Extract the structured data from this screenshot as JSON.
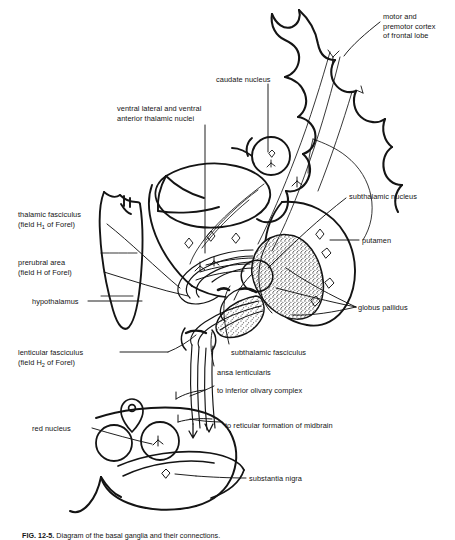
{
  "figure": {
    "domain": "anatomical-line-diagram",
    "background_color": "#ffffff",
    "ink_color": "#141414",
    "stipple_color": "#2b2b2b"
  },
  "labels": {
    "motor_cortex": {
      "id": "motor-and-premotor-cortex",
      "lines": [
        "motor and",
        "premotor cortex",
        "of frontal lobe"
      ],
      "x": 383,
      "y": 12,
      "align": "left"
    },
    "caudate_nucleus": {
      "id": "caudate-nucleus",
      "lines": [
        "caudate nucleus"
      ],
      "x": 216,
      "y": 75,
      "align": "left"
    },
    "ventral_thalamic": {
      "id": "ventral-lateral-and-ventral-anterior-thalamic-nuclei",
      "lines": [
        "ventral lateral and ventral",
        "anterior thalamic nuclei"
      ],
      "x": 117,
      "y": 104,
      "align": "left"
    },
    "subthalamic_nucleus": {
      "id": "subthalamic-nucleus",
      "lines": [
        "subthalamic nucleus"
      ],
      "x": 349,
      "y": 192,
      "align": "left"
    },
    "thalamic_fasciculus": {
      "id": "thalamic-fasciculus",
      "lines": [
        "thalamic fasciculus",
        "(field H₁ of Forel)"
      ],
      "line1": "thalamic fasciculus",
      "line2_pre": "(field H",
      "line2_sub": "1",
      "line2_post": " of Forel)",
      "x": 18,
      "y": 210,
      "align": "left"
    },
    "putamen": {
      "id": "putamen",
      "lines": [
        "putamen"
      ],
      "x": 362,
      "y": 236,
      "align": "left"
    },
    "prerubral_area": {
      "id": "prerubral-area",
      "lines": [
        "prerubral area",
        "(field H of Forel)"
      ],
      "x": 18,
      "y": 258,
      "align": "left"
    },
    "hypothalamus": {
      "id": "hypothalamus",
      "lines": [
        "hypothalamus"
      ],
      "x": 32,
      "y": 297,
      "align": "left"
    },
    "globus_pallidus": {
      "id": "globus-pallidus",
      "lines": [
        "globus pallidus"
      ],
      "x": 358,
      "y": 303,
      "align": "left"
    },
    "lenticular_fasciculus": {
      "id": "lenticular-fasciculus",
      "lines": [
        "lenticular fasciculus",
        "(field H₂ of Forel)"
      ],
      "line1": "lenticular fasciculus",
      "line2_pre": "(field H",
      "line2_sub": "2",
      "line2_post": " of Forel)",
      "x": 18,
      "y": 348,
      "align": "left"
    },
    "subthalamic_fasciculus": {
      "id": "subthalamic-fasciculus",
      "lines": [
        "subthalamic fasciculus"
      ],
      "x": 231,
      "y": 348,
      "align": "left"
    },
    "ansa_lenticularis": {
      "id": "ansa-lenticularis",
      "lines": [
        "ansa lenticularis"
      ],
      "x": 217,
      "y": 368,
      "align": "left"
    },
    "inferior_olivary": {
      "id": "to-inferior-olivary-complex",
      "lines": [
        "to inferior olivary complex"
      ],
      "x": 217,
      "y": 386,
      "align": "left"
    },
    "reticular_formation": {
      "id": "to-reticular-formation-of-midbrain",
      "lines": [
        "to reticular formation of midbrain"
      ],
      "x": 225,
      "y": 421,
      "align": "left"
    },
    "red_nucleus": {
      "id": "red-nucleus",
      "lines": [
        "red nucleus"
      ],
      "x": 32,
      "y": 424,
      "align": "left"
    },
    "substantia_nigra": {
      "id": "substantia-nigra",
      "lines": [
        "substantia nigra"
      ],
      "x": 249,
      "y": 474,
      "align": "left"
    }
  },
  "caption": {
    "number": "FIG. 12-5.",
    "text": " Diagram of the basal ganglia and their connections."
  },
  "structures": [
    {
      "name": "cerebral-cortex-outline",
      "kind": "outline"
    },
    {
      "name": "caudate-nucleus-circle",
      "kind": "circle"
    },
    {
      "name": "thalamus-body",
      "kind": "outline"
    },
    {
      "name": "hypothalamus-body",
      "kind": "outline"
    },
    {
      "name": "putamen-outline",
      "kind": "outline"
    },
    {
      "name": "globus-pallidus-stippled",
      "kind": "stippled-region"
    },
    {
      "name": "subthalamic-nucleus-body",
      "kind": "outline"
    },
    {
      "name": "red-nucleus-circles",
      "kind": "circles"
    },
    {
      "name": "substantia-nigra-band",
      "kind": "outline"
    },
    {
      "name": "midbrain-outline",
      "kind": "outline"
    },
    {
      "name": "descending-fiber-bundle",
      "kind": "fibers"
    },
    {
      "name": "ansa-lenticularis-loop",
      "kind": "fibers"
    },
    {
      "name": "lenticular-fasciculus-fibers",
      "kind": "fibers"
    }
  ]
}
